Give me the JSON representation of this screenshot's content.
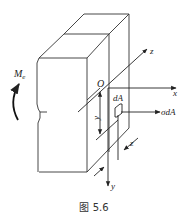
{
  "figure": {
    "caption": "图 5.6",
    "labels": {
      "moment": "M",
      "moment_sub": "e",
      "origin": "O",
      "x_axis": "x",
      "y_axis": "y",
      "z_axis": "z",
      "z_distance": "z",
      "y_distance": "y",
      "area_element": "dA",
      "stress_force": "σdA"
    },
    "colors": {
      "line": "#333333",
      "background": "#ffffff"
    }
  }
}
